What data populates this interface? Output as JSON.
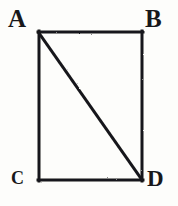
{
  "figure": {
    "kind": "geometry-diagram",
    "shape": "rectangle-with-diagonal",
    "background_color": "#fdfdfb",
    "ink_color": "#18181a",
    "stroke_width_px": 3,
    "canvas": {
      "width": 178,
      "height": 206
    },
    "rectangle": {
      "left": 38,
      "top": 31,
      "right": 143,
      "bottom": 181,
      "width": 105,
      "height": 150
    },
    "diagonal": {
      "from": "A",
      "to": "D",
      "x1": 38,
      "y1": 31,
      "x2": 143,
      "y2": 181
    },
    "vertices": [
      {
        "id": "A",
        "label": "A",
        "position": "top-left",
        "x": 38,
        "y": 31
      },
      {
        "id": "B",
        "label": "B",
        "position": "top-right",
        "x": 143,
        "y": 31
      },
      {
        "id": "C",
        "label": "C",
        "position": "bottom-left",
        "x": 38,
        "y": 181
      },
      {
        "id": "D",
        "label": "D",
        "position": "bottom-right",
        "x": 143,
        "y": 181
      }
    ],
    "edges": [
      {
        "id": "AB",
        "label": "AB",
        "from": "A",
        "to": "B"
      },
      {
        "id": "BD",
        "label": "BD",
        "from": "B",
        "to": "D"
      },
      {
        "id": "CD",
        "label": "CD",
        "from": "C",
        "to": "D"
      },
      {
        "id": "AC",
        "label": "AC",
        "from": "A",
        "to": "C"
      },
      {
        "id": "AD",
        "label": "AD",
        "from": "A",
        "to": "D"
      }
    ]
  }
}
